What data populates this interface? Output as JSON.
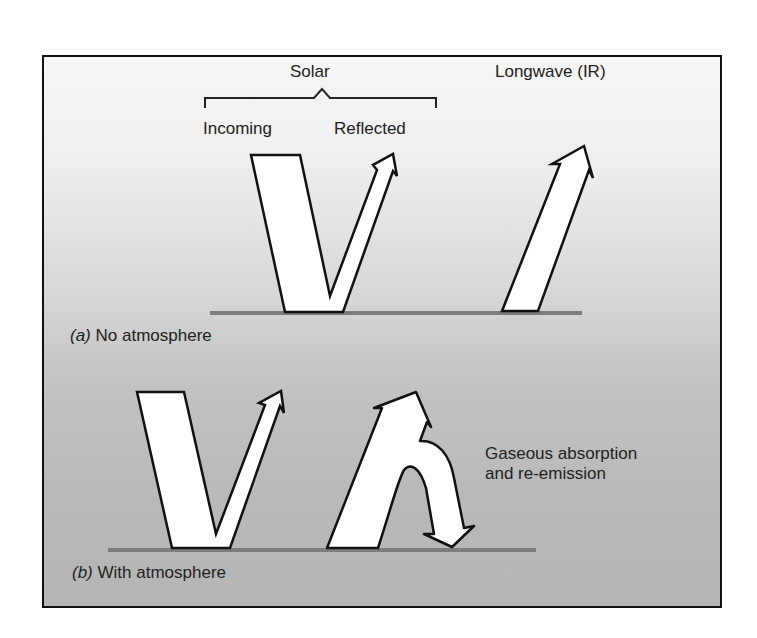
{
  "panel_a": {
    "group_label": "Solar",
    "incoming_label": "Incoming",
    "reflected_label": "Reflected",
    "longwave_label": "Longwave (IR)",
    "caption_letter": "(a)",
    "caption_text": "No atmosphere"
  },
  "panel_b": {
    "annotation_line1": "Gaseous absorption",
    "annotation_line2": "and re-emission",
    "caption_letter": "(b)",
    "caption_text": "With atmosphere"
  },
  "colors": {
    "arrow_fill": "#ffffff",
    "arrow_stroke": "#111111",
    "ground": "#7d7d7d",
    "frame_border": "#111111"
  }
}
